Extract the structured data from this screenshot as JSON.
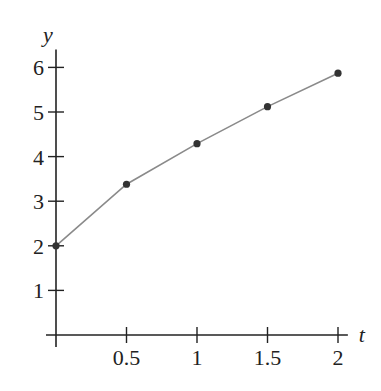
{
  "chart_data": {
    "type": "line",
    "title": "",
    "xlabel": "t",
    "ylabel": "y",
    "x": [
      0,
      0.5,
      1,
      1.5,
      2
    ],
    "series": [
      {
        "name": "y",
        "values": [
          2.0,
          3.38,
          4.29,
          5.12,
          5.87
        ],
        "markers": true
      }
    ],
    "xticks": [
      0.5,
      1,
      1.5,
      2
    ],
    "xtick_labels": [
      "0.5",
      "1",
      "1.5",
      "2"
    ],
    "yticks": [
      1,
      2,
      3,
      4,
      5,
      6
    ],
    "ytick_labels": [
      "1",
      "2",
      "3",
      "4",
      "5",
      "6"
    ],
    "xlim": [
      0,
      2.1
    ],
    "ylim": [
      0,
      6.4
    ],
    "grid": false,
    "legend": null
  },
  "colors": {
    "axis": "#222222",
    "line": "#8a8a8a",
    "marker": "#333333"
  }
}
